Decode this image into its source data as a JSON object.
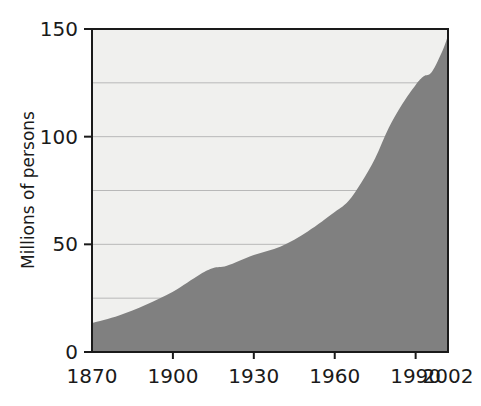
{
  "chart_data": {
    "type": "area",
    "title": "",
    "subtitle": "",
    "xlabel": "",
    "ylabel": "Millions of persons",
    "xlim": [
      1870,
      2002
    ],
    "ylim": [
      0,
      150
    ],
    "grid": true,
    "grid_values": [
      25,
      50,
      75,
      100,
      125
    ],
    "legend": "none",
    "legend_position": "none",
    "x_tick_labels": [
      "1870",
      "1900",
      "1930",
      "1960",
      "1990",
      "2002"
    ],
    "x_tick_values": [
      1870,
      1900,
      1930,
      1960,
      1990,
      2002
    ],
    "y_tick_labels": [
      "0",
      "50",
      "100",
      "150"
    ],
    "y_tick_values": [
      0,
      50,
      100,
      150
    ],
    "series": [
      {
        "name": "Population",
        "fill_color": "#808080",
        "x": [
          1870,
          1880,
          1890,
          1900,
          1910,
          1915,
          1920,
          1930,
          1940,
          1950,
          1960,
          1965,
          1970,
          1975,
          1980,
          1985,
          1990,
          1993,
          1996,
          2000,
          2002
        ],
        "values": [
          13.5,
          17,
          22,
          28,
          36,
          39,
          40,
          45,
          49,
          56,
          65,
          70,
          79,
          90,
          104,
          115,
          124,
          128,
          130,
          140,
          147
        ]
      }
    ],
    "annotations": []
  },
  "style": {
    "plot_background": "#f0f0ee",
    "area_fill": "#808080",
    "gridline_color": "#b8b8b8",
    "axis_color": "#1a1a1a",
    "page_background": "#ffffff"
  },
  "geometry": {
    "plot_left": 92,
    "plot_right": 448,
    "plot_top": 29,
    "plot_bottom": 352
  }
}
